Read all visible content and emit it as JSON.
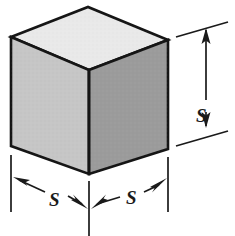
{
  "figure": {
    "shape": "cube"
  },
  "labels": {
    "height": "S",
    "width_left": "S",
    "width_right": "S"
  },
  "colors": {
    "top_face": "#e9e9e9",
    "left_face": "#c6c6c6",
    "right_face": "#9b9b9b",
    "outline": "#151515",
    "dimension_line": "#1a1a1a",
    "background": "#ffffff"
  },
  "geometry": {
    "top_apex": [
      88,
      7
    ],
    "left_top": [
      11,
      37
    ],
    "right_top": [
      168,
      40
    ],
    "front_top": [
      89,
      70
    ],
    "left_bottom": [
      11,
      146
    ],
    "right_bottom": [
      168,
      149
    ],
    "front_bottom": [
      89,
      174
    ]
  },
  "dimensions": {
    "height_extension_top_y": 27,
    "height_extension_bottom_y": 146,
    "height_arrow_x": 206,
    "width_baseline_y": 212
  },
  "icons": {
    "arrow_up": "arrow-up",
    "arrow_down": "arrow-down",
    "arrow_left": "arrow-left",
    "arrow_right": "arrow-right"
  }
}
